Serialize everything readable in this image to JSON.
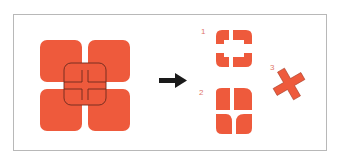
{
  "diagram": {
    "fill_color": "#ee5a3c",
    "outline_color": "#6b2a1e",
    "arrow_color": "#1a1a1a",
    "frame_color": "#b8b8b8",
    "label_color": "#e0786a",
    "source": {
      "description": "Four overlapping rounded squares with overlap outlines"
    },
    "arrow": {
      "direction": "right"
    },
    "results": [
      {
        "label": "1",
        "description": "Four rounded pieces with central hole (subtract overlap)"
      },
      {
        "label": "2",
        "description": "Four leaf-shaped pieces (divide)"
      },
      {
        "label": "3",
        "description": "Rotated cross shape (intersection)"
      }
    ]
  }
}
